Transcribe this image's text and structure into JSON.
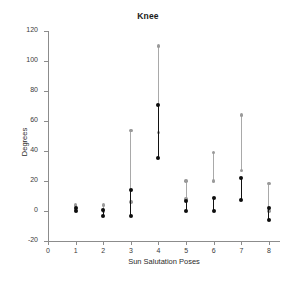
{
  "chart_data": {
    "type": "scatter",
    "title": "Knee",
    "xlabel": "Sun Salutation Poses",
    "ylabel": "Degrees",
    "xlim": [
      0,
      8.4
    ],
    "ylim": [
      -20,
      120
    ],
    "xticks": [
      0,
      1,
      2,
      3,
      4,
      5,
      6,
      7,
      8
    ],
    "yticks": [
      -20,
      0,
      20,
      40,
      60,
      80,
      100,
      120
    ],
    "grid": false,
    "legend": null,
    "colors": {
      "primary_series": "#0d0d0d",
      "secondary_series": "#9a9a9a"
    },
    "categories": [
      "1",
      "2",
      "3",
      "4",
      "5",
      "6",
      "7",
      "8"
    ],
    "series": [
      {
        "name": "Black range",
        "color": "#0d0d0d",
        "low": [
          0,
          -3,
          -3,
          35.5,
          0,
          0,
          7.5,
          -6
        ],
        "high": [
          2,
          1,
          14,
          70.5,
          6.5,
          9,
          22,
          2
        ]
      },
      {
        "name": "Gray range",
        "color": "#9a9a9a",
        "low": [
          1,
          0,
          6,
          52.5,
          8,
          20,
          27,
          0
        ],
        "high": [
          4,
          4,
          53.5,
          110,
          20,
          39,
          64,
          18.5
        ]
      }
    ],
    "points": [
      {
        "pose": 1,
        "black_low": 0,
        "black_high": 2,
        "gray_low": 1,
        "gray_high": 4
      },
      {
        "pose": 2,
        "black_low": -3,
        "black_high": 1,
        "gray_low": 0,
        "gray_high": 4
      },
      {
        "pose": 3,
        "black_low": -3,
        "black_high": 14,
        "gray_low": 6,
        "gray_high": 53.5
      },
      {
        "pose": 4,
        "black_low": 35.5,
        "black_high": 70.5,
        "gray_low": 52.5,
        "gray_high": 110
      },
      {
        "pose": 5,
        "black_low": 0,
        "black_high": 6.5,
        "gray_low": 8,
        "gray_high": 20
      },
      {
        "pose": 6,
        "black_low": 0,
        "black_high": 9,
        "gray_low": 20,
        "gray_high": 39
      },
      {
        "pose": 7,
        "black_low": 7.5,
        "black_high": 22,
        "gray_low": 27,
        "gray_high": 64
      },
      {
        "pose": 8,
        "black_low": -6,
        "black_high": 2,
        "gray_low": 0,
        "gray_high": 18.5
      }
    ]
  }
}
